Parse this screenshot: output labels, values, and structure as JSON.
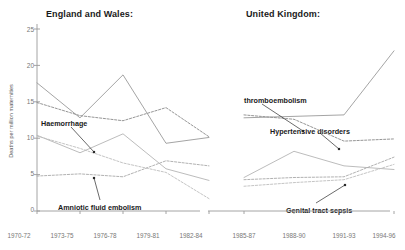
{
  "chart_data": {
    "type": "line",
    "ylabel": "Deaths per million maternities",
    "xlabel": "",
    "ylim": [
      0,
      25
    ],
    "yticks": [
      0,
      5,
      10,
      15,
      20,
      25
    ],
    "grid": false,
    "legend_position": "inline-annotations",
    "panels": [
      {
        "name": "england-wales",
        "title": "England and Wales:",
        "categories": [
          "1970-72",
          "1973-75",
          "1976-78",
          "1979-81",
          "1982-84"
        ],
        "series": [
          {
            "name": "Thromboembolism",
            "style": "solid",
            "color": "#9a9a9a",
            "values": [
              17.6,
              12.8,
              18.7,
              9.3,
              10.1
            ]
          },
          {
            "name": "Hypertensive disorders",
            "style": "dashed",
            "color": "#8a8a8a",
            "values": [
              14.9,
              13.1,
              12.4,
              14.2,
              10.2
            ]
          },
          {
            "name": "Haemorrhage",
            "style": "solid",
            "color": "#b4b4b4",
            "values": [
              10.4,
              8.0,
              10.6,
              5.8,
              4.2
            ]
          },
          {
            "name": "Amniotic fluid embolism",
            "style": "dashed",
            "color": "#a8a8a8",
            "values": [
              4.8,
              5.1,
              4.7,
              6.9,
              6.2
            ]
          },
          {
            "name": "Genital tract sepsis",
            "style": "dashed",
            "color": "#bdbdbd",
            "values": [
              10.3,
              8.6,
              6.6,
              5.3,
              1.7
            ]
          }
        ],
        "annotations": [
          {
            "label": "Haemorrhage",
            "target_series": "Haemorrhage",
            "target_x": "1976-78"
          },
          {
            "label": "Amniotic fluid embolism",
            "target_series": "Amniotic fluid embolism",
            "target_x": "1976-78"
          }
        ]
      },
      {
        "name": "united-kingdom",
        "title": "United Kingdom:",
        "categories": [
          "1985-87",
          "1988-90",
          "1991-93",
          "1994-96"
        ],
        "series": [
          {
            "name": "Thromboembolism",
            "style": "solid",
            "color": "#9a9a9a",
            "values": [
              12.8,
              13.0,
              13.2,
              22.0
            ]
          },
          {
            "name": "Hypertensive disorders",
            "style": "dashed",
            "color": "#8a8a8a",
            "values": [
              13.2,
              12.6,
              9.6,
              9.9
            ]
          },
          {
            "name": "Haemorrhage",
            "style": "solid",
            "color": "#b4b4b4",
            "values": [
              4.6,
              8.2,
              6.2,
              5.7
            ]
          },
          {
            "name": "Amniotic fluid embolism",
            "style": "dashed",
            "color": "#a8a8a8",
            "values": [
              4.3,
              4.6,
              4.7,
              7.4
            ]
          },
          {
            "name": "Genital tract sepsis",
            "style": "dashed",
            "color": "#bdbdbd",
            "values": [
              3.4,
              3.9,
              4.3,
              6.4
            ]
          }
        ],
        "annotations": [
          {
            "label": "thromboembolism",
            "target_series": "Thromboembolism",
            "target_x": "1985-87"
          },
          {
            "label": "Hypertensive disorders",
            "target_series": "Hypertensive disorders",
            "target_x": "1991-93"
          },
          {
            "label": "Genital tract sepsis",
            "target_series": "Genital tract sepsis",
            "target_x": "1991-93"
          }
        ]
      }
    ]
  },
  "axes": {
    "y_label": "Deaths per million maternities",
    "y_ticks": [
      "25",
      "20",
      "15",
      "10",
      "5",
      "0"
    ],
    "x_ticks_left": [
      "1970-72",
      "1973-75",
      "1976-78",
      "1979-81",
      "1982-84"
    ],
    "x_ticks_right": [
      "1985-87",
      "1988-90",
      "1991-93",
      "1994-96"
    ]
  },
  "titles": {
    "left_panel": "England and Wales:",
    "right_panel": "United Kingdom:"
  },
  "annotations": {
    "haemorrhage": "Haemorrhage",
    "amniotic": "Amniotic fluid embolism",
    "thromboembolism": "thromboembolism",
    "hypertensive": "Hypertensive disorders",
    "sepsis": "Genital tract sepsis"
  },
  "colors": {
    "axis": "#9a9a9a",
    "tick_text": "#777777",
    "title_text": "#1a1a1a",
    "series_solid_dark": "#9a9a9a",
    "series_dashed_dark": "#8a8a8a",
    "series_solid_light": "#b4b4b4",
    "series_dashed_light": "#a8a8a8",
    "series_dashed_pale": "#bdbdbd"
  }
}
